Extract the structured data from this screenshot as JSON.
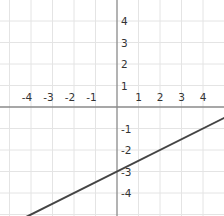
{
  "chart_data": {
    "type": "line",
    "title": "",
    "xlabel": "",
    "ylabel": "",
    "xlim": [
      -5.4,
      5.0
    ],
    "ylim": [
      -5.0,
      5.0
    ],
    "grid": true,
    "x_ticks": [
      "-4",
      "-3",
      "-2",
      "-1",
      "1",
      "2",
      "3",
      "4"
    ],
    "y_ticks": [
      "4",
      "3",
      "2",
      "1",
      "-1",
      "-2",
      "-3",
      "-4"
    ],
    "series": [
      {
        "name": "line",
        "equation": "y = 0.5x - 3",
        "slope": 0.5,
        "intercept": -3,
        "x": [
          -4,
          -2,
          0,
          2,
          4
        ],
        "values": [
          -5,
          -4,
          -3,
          -2,
          -1
        ]
      }
    ],
    "colors": {
      "grid": "#e4e4e4",
      "axis": "#8a8a8a",
      "line": "#444444"
    }
  }
}
